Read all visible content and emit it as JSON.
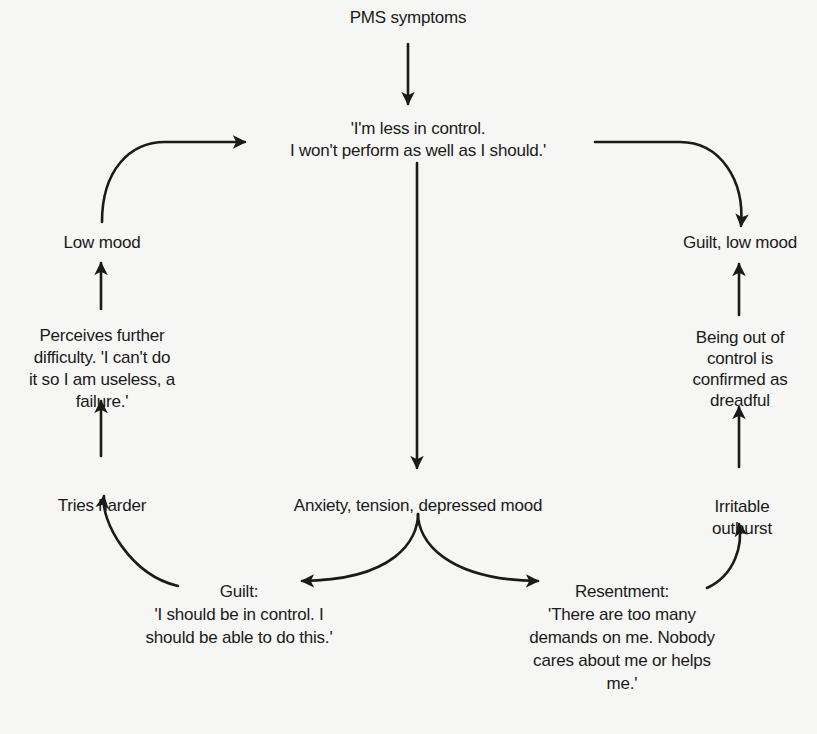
{
  "diagram": {
    "type": "flowchart",
    "nodes": {
      "pms_symptoms": {
        "lines": [
          "PMS symptoms"
        ]
      },
      "less_in_control": {
        "lines": [
          "'I'm less in control.",
          "I won't perform as well as I should.'"
        ]
      },
      "anxiety": {
        "lines": [
          "Anxiety, tension, depressed mood"
        ]
      },
      "guilt": {
        "lines": [
          "Guilt:",
          "'I should be in control. I",
          "should be able to do this.'"
        ]
      },
      "resentment": {
        "lines": [
          "Resentment:",
          "'There are too many",
          "demands on me. Nobody",
          "cares about me or helps",
          "me.'"
        ]
      },
      "tries_harder": {
        "lines": [
          "Tries harder"
        ]
      },
      "perceives_difficulty": {
        "lines": [
          "Perceives further",
          "difficulty. 'I can't do",
          "it so I am useless, a",
          "failure.'"
        ]
      },
      "low_mood": {
        "lines": [
          "Low mood"
        ]
      },
      "irritable_outburst": {
        "lines": [
          "Irritable",
          "outburst"
        ]
      },
      "out_of_control": {
        "lines": [
          "Being out of",
          "control is",
          "confirmed as",
          "dreadful"
        ]
      },
      "guilt_low_mood": {
        "lines": [
          "Guilt, low mood"
        ]
      }
    },
    "edges": [
      {
        "from": "pms_symptoms",
        "to": "less_in_control"
      },
      {
        "from": "less_in_control",
        "to": "anxiety"
      },
      {
        "from": "anxiety",
        "to": "guilt"
      },
      {
        "from": "anxiety",
        "to": "resentment"
      },
      {
        "from": "guilt",
        "to": "tries_harder"
      },
      {
        "from": "tries_harder",
        "to": "perceives_difficulty"
      },
      {
        "from": "perceives_difficulty",
        "to": "low_mood"
      },
      {
        "from": "low_mood",
        "to": "less_in_control"
      },
      {
        "from": "resentment",
        "to": "irritable_outburst"
      },
      {
        "from": "irritable_outburst",
        "to": "out_of_control"
      },
      {
        "from": "out_of_control",
        "to": "guilt_low_mood"
      },
      {
        "from": "less_in_control",
        "to": "guilt_low_mood"
      }
    ]
  },
  "style": {
    "ink": "#1a1a1a",
    "paper": "#f6f6f4"
  }
}
